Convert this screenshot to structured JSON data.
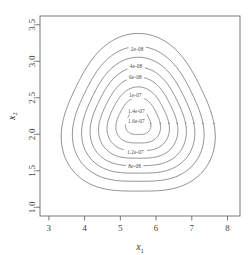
{
  "chart_data": {
    "type": "contour",
    "title": "",
    "xlabel": "x1",
    "ylabel": "x2",
    "xlabel_display": "x",
    "xlabel_sub": "1",
    "ylabel_display": "x",
    "ylabel_sub": "2",
    "xlim": [
      2.75,
      8.35
    ],
    "ylim": [
      0.88,
      3.62
    ],
    "xticks": [
      "3",
      "4",
      "5",
      "6",
      "7",
      "8"
    ],
    "xtick_values": [
      3,
      4,
      5,
      6,
      7,
      8
    ],
    "yticks": [
      "1.0",
      "1.5",
      "2.0",
      "2.5",
      "3.0",
      "3.5"
    ],
    "ytick_values": [
      1.0,
      1.5,
      2.0,
      2.5,
      3.0,
      3.5
    ],
    "grid": false,
    "legend": "none",
    "peak": {
      "x": 5.5,
      "y": 2.15
    },
    "levels": [
      2e-08,
      4e-08,
      6e-08,
      8e-08,
      1e-07,
      1.2e-07,
      1.4e-07,
      1.6e-07
    ],
    "level_labels": [
      "2e-08",
      "4e-08",
      "6e-08",
      "8e-08",
      "1e-07",
      "1.2e-07",
      "1.4e-07",
      "1.6e-07"
    ],
    "contours": [
      {
        "label": "2e-08",
        "value": 2e-08,
        "label_position": "top",
        "label_x": 5.47,
        "label_y": 3.17,
        "scale": 1.0
      },
      {
        "label": "4e-08",
        "value": 4e-08,
        "label_position": "top",
        "label_x": 5.44,
        "label_y": 2.93,
        "scale": 0.855
      },
      {
        "label": "6e-08",
        "value": 6e-08,
        "label_position": "top",
        "label_x": 5.42,
        "label_y": 2.78,
        "scale": 0.735
      },
      {
        "label": "8e-08",
        "value": 8e-08,
        "label_position": "bottom",
        "label_x": 5.4,
        "label_y": 1.57,
        "scale": 0.625
      },
      {
        "label": "1e-07",
        "value": 1e-07,
        "label_position": "top",
        "label_x": 5.42,
        "label_y": 2.53,
        "scale": 0.515
      },
      {
        "label": "1.2e-07",
        "value": 1.2e-07,
        "label_position": "bottom",
        "label_x": 5.42,
        "label_y": 1.75,
        "scale": 0.405
      },
      {
        "label": "1.4e-07",
        "value": 1.4e-07,
        "label_position": "top",
        "label_x": 5.45,
        "label_y": 2.32,
        "scale": 0.29
      },
      {
        "label": "1.6e-07",
        "value": 1.6e-07,
        "label_position": "top",
        "label_x": 5.45,
        "label_y": 2.18,
        "scale": 0.165
      }
    ],
    "shape_note": "rounded triangular closed loops, apex up, nested about peak",
    "colors": {
      "contour_line": "#555555",
      "axis": "#6b6b6b",
      "text": "#444444",
      "background": "#ffffff"
    }
  }
}
